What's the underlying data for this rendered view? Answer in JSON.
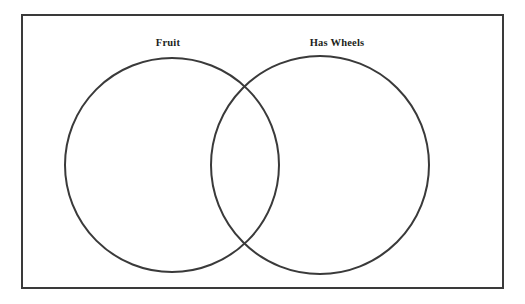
{
  "diagram": {
    "type": "venn-diagram",
    "title": "",
    "background_color": "#ffffff",
    "stroke_color": "#3a3a3a",
    "label_color": "#231f20",
    "frame": {
      "name": "universal-set-box",
      "x": 22,
      "y": 15,
      "width": 481,
      "height": 273,
      "stroke_width": 2
    },
    "sets": [
      {
        "id": "left",
        "label": "Fruit",
        "circle": {
          "cx": 172,
          "cy": 165,
          "r": 107
        },
        "label_position": {
          "x": 168,
          "y": 46
        },
        "items": []
      },
      {
        "id": "right",
        "label": "Has Wheels",
        "circle": {
          "cx": 320,
          "cy": 165,
          "r": 109
        },
        "label_position": {
          "x": 337,
          "y": 46
        },
        "items": []
      }
    ],
    "intersection": {
      "name": "overlap-region",
      "label": "",
      "items": [],
      "upper_point": {
        "x": 245,
        "y": 88
      },
      "lower_point": {
        "x": 245,
        "y": 243
      }
    }
  }
}
